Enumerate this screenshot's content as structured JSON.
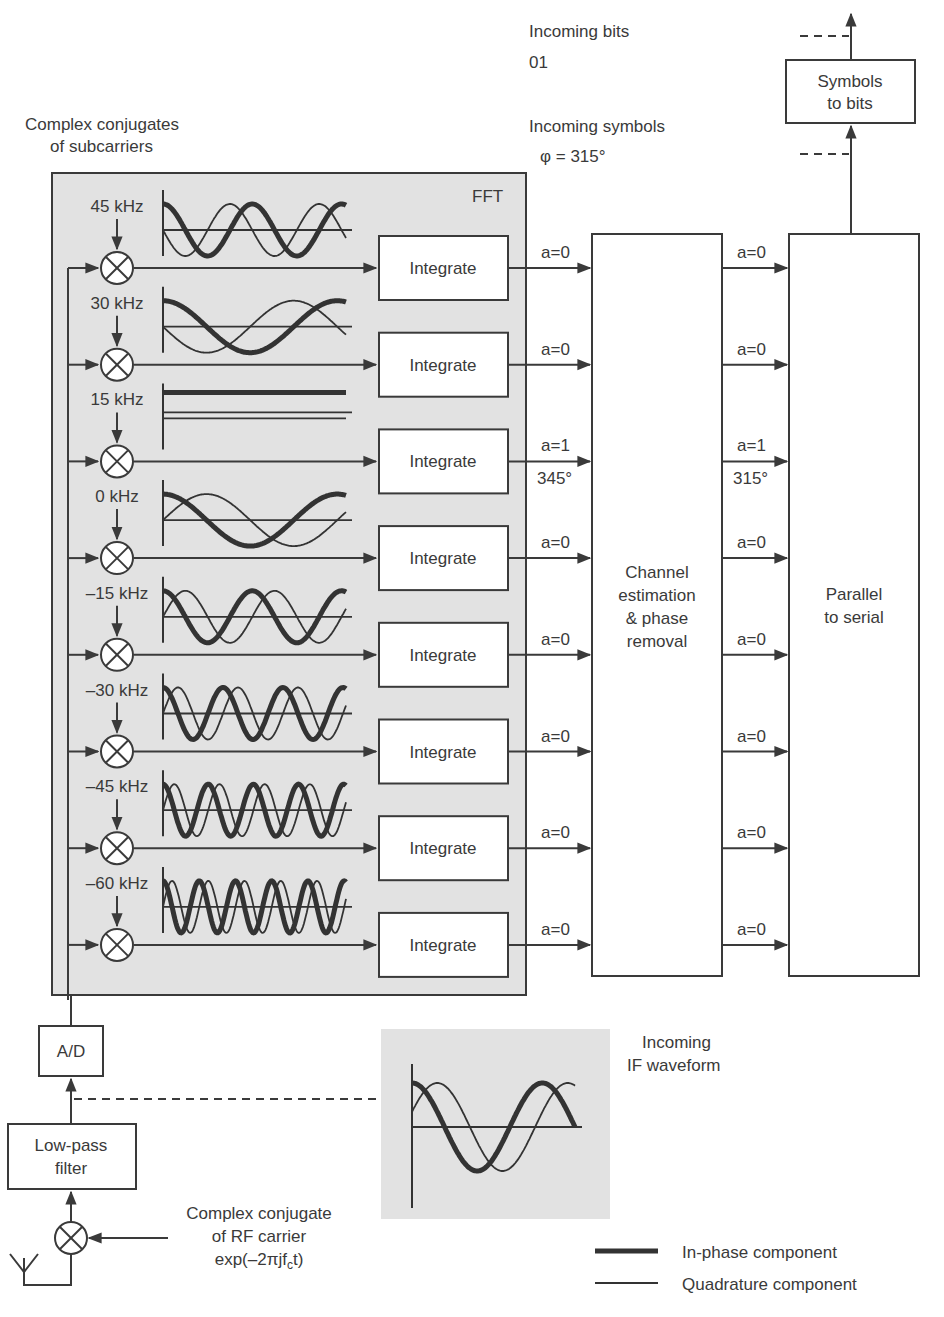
{
  "header": {
    "incoming_bits_label": "Incoming bits",
    "incoming_bits_value": "01",
    "incoming_symbols_label": "Incoming symbols",
    "incoming_symbols_phase": "φ =  315°"
  },
  "subcarrier_caption": [
    "Complex conjugates",
    "of subcarriers"
  ],
  "fft_label": "FFT",
  "subcarriers": [
    {
      "freq": "45 kHz",
      "cycles": 2.0,
      "in_a": "a=0",
      "in_phase": "",
      "out_a": "a=0",
      "out_phase": ""
    },
    {
      "freq": "30 kHz",
      "cycles": 1.0,
      "in_a": "a=0",
      "in_phase": "",
      "out_a": "a=0",
      "out_phase": ""
    },
    {
      "freq": "15 kHz",
      "cycles": 0.0,
      "in_a": "a=1",
      "in_phase": "345°",
      "out_a": "a=1",
      "out_phase": "315°"
    },
    {
      "freq": "0 kHz",
      "cycles": 1.0,
      "in_a": "a=0",
      "in_phase": "",
      "out_a": "a=0",
      "out_phase": ""
    },
    {
      "freq": "–15 kHz",
      "cycles": 2.0,
      "in_a": "a=0",
      "in_phase": "",
      "out_a": "a=0",
      "out_phase": ""
    },
    {
      "freq": "–30 kHz",
      "cycles": 3.0,
      "in_a": "a=0",
      "in_phase": "",
      "out_a": "a=0",
      "out_phase": ""
    },
    {
      "freq": "–45 kHz",
      "cycles": 4.0,
      "in_a": "a=0",
      "in_phase": "",
      "out_a": "a=0",
      "out_phase": ""
    },
    {
      "freq": "–60 kHz",
      "cycles": 5.0,
      "in_a": "a=0",
      "in_phase": "",
      "out_a": "a=0",
      "out_phase": ""
    }
  ],
  "integrate_label": "Integrate",
  "blocks": {
    "channel_estimation": [
      "Channel",
      "estimation",
      "& phase",
      "removal"
    ],
    "parallel_to_serial": [
      "Parallel",
      "to serial"
    ],
    "symbols_to_bits": [
      "Symbols",
      "to bits"
    ],
    "ad": "A/D",
    "low_pass": [
      "Low-pass",
      "filter"
    ]
  },
  "rf_carrier_caption": [
    "Complex conjugate",
    "of RF carrier",
    "exp(–2πjf",
    "c",
    "t)"
  ],
  "if_waveform_caption": [
    "Incoming",
    "IF waveform"
  ],
  "legend": {
    "in_phase": "In-phase component",
    "quadrature": "Quadrature component"
  },
  "colors": {
    "panel_fill": "#e2e2e2",
    "line": "#3a3a3a",
    "box_fill": "#ffffff"
  }
}
